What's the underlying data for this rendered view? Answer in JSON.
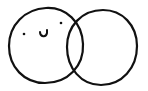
{
  "drawing": {
    "description": "Two overlapping hand-drawn circles; left circle has a smiley face",
    "stroke_color": "#111111",
    "background_color": "#ffffff",
    "left_circle": {
      "cx": 46,
      "cy": 46,
      "rx": 37,
      "ry": 37
    },
    "right_circle": {
      "cx": 102,
      "cy": 47,
      "rx": 35,
      "ry": 37
    },
    "face": {
      "left_eye": {
        "cx": 24,
        "cy": 34
      },
      "right_eye": {
        "cx": 61,
        "cy": 23
      },
      "mouth": "smile"
    }
  }
}
